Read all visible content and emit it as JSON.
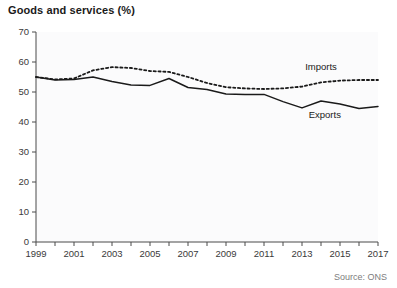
{
  "chart_data": {
    "type": "line",
    "title": "Goods and services (%)",
    "xlabel": "",
    "ylabel": "",
    "source": "Source: ONS",
    "grid": false,
    "legend_position": "inline-annotation",
    "xlim": [
      1999,
      2017
    ],
    "ylim": [
      0,
      70
    ],
    "ytick_values": [
      0,
      10,
      20,
      30,
      40,
      50,
      60,
      70
    ],
    "ytick_labels": [
      "0",
      "10",
      "20",
      "30",
      "40",
      "50",
      "60",
      "70"
    ],
    "xtick_values": [
      1999,
      2000,
      2001,
      2002,
      2003,
      2004,
      2005,
      2006,
      2007,
      2008,
      2009,
      2010,
      2011,
      2012,
      2013,
      2014,
      2015,
      2016,
      2017
    ],
    "xtick_labels": [
      "1999",
      "",
      "2001",
      "",
      "2003",
      "",
      "2005",
      "",
      "2007",
      "",
      "2009",
      "",
      "2011",
      "",
      "2013",
      "",
      "2015",
      "",
      "2017"
    ],
    "x": [
      1999,
      2000,
      2001,
      2002,
      2003,
      2004,
      2005,
      2006,
      2007,
      2008,
      2009,
      2010,
      2011,
      2012,
      2013,
      2014,
      2015,
      2016,
      2017
    ],
    "series": [
      {
        "name": "Imports",
        "style": "dotted",
        "color": "#1a1a1a",
        "values": [
          55.0,
          54.2,
          54.5,
          57.2,
          58.3,
          58.0,
          57.0,
          56.7,
          55.0,
          53.0,
          51.6,
          51.2,
          51.0,
          51.2,
          51.8,
          53.2,
          53.8,
          54.0,
          54.0
        ]
      },
      {
        "name": "Exports",
        "style": "solid",
        "color": "#1a1a1a",
        "values": [
          55.0,
          54.0,
          54.2,
          55.0,
          53.5,
          52.3,
          52.2,
          54.5,
          51.5,
          50.8,
          49.3,
          49.2,
          49.2,
          46.8,
          44.7,
          47.0,
          46.0,
          44.5,
          45.2
        ]
      }
    ],
    "annotations": [
      {
        "text": "Imports",
        "x": 2014,
        "y": 57.5
      },
      {
        "text": "Exports",
        "x": 2014.2,
        "y": 41.5
      }
    ]
  }
}
